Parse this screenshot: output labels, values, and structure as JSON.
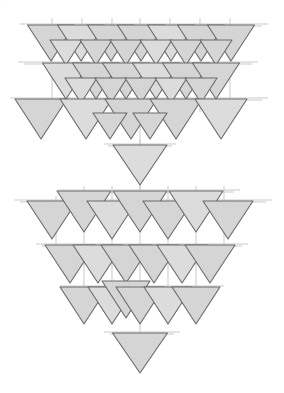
{
  "figure": {
    "corner_mark": "··",
    "canvas": {
      "width": 284,
      "height": 393,
      "background": "#ffffff"
    },
    "style": {
      "triangle_fill": "#d5d5d5",
      "triangle_fill_light": "#dcdcdc",
      "triangle_stroke": "#6a6a6a",
      "triangle_stroke_width": 1.1,
      "guide_line_color": "#c9c9c9",
      "guide_line_width": 1,
      "bar_fill": "#d0d0d0",
      "bar_stroke": "#9a9a9a"
    },
    "clusters": [
      {
        "name": "upper-cluster",
        "rows": 4,
        "apex_count": 1
      },
      {
        "name": "lower-cluster",
        "rows": 4,
        "apex_count": 1
      }
    ]
  },
  "chart_data": {
    "type": "scatter",
    "xlabel": "",
    "ylabel": "",
    "xlim": [
      0,
      284
    ],
    "ylim": [
      0,
      393
    ],
    "grid": false,
    "legend": null,
    "marker": "triangle-down",
    "annotations": [],
    "guide_lines": [
      {
        "orient": "h",
        "x1": 20,
        "x2": 268,
        "y": 24
      },
      {
        "orient": "h",
        "x1": 28,
        "x2": 262,
        "y": 26
      },
      {
        "orient": "h",
        "x1": 18,
        "x2": 258,
        "y": 62
      },
      {
        "orient": "h",
        "x1": 24,
        "x2": 252,
        "y": 64
      },
      {
        "orient": "h",
        "x1": 10,
        "x2": 268,
        "y": 98
      },
      {
        "orient": "h",
        "x1": 16,
        "x2": 262,
        "y": 100
      },
      {
        "orient": "h",
        "x1": 104,
        "x2": 176,
        "y": 144
      },
      {
        "orient": "h",
        "x1": 108,
        "x2": 172,
        "y": 146
      },
      {
        "orient": "h",
        "x1": 58,
        "x2": 240,
        "y": 190
      },
      {
        "orient": "h",
        "x1": 64,
        "x2": 234,
        "y": 192
      },
      {
        "orient": "h",
        "x1": 14,
        "x2": 272,
        "y": 200
      },
      {
        "orient": "h",
        "x1": 20,
        "x2": 266,
        "y": 202
      },
      {
        "orient": "h",
        "x1": 36,
        "x2": 248,
        "y": 244
      },
      {
        "orient": "h",
        "x1": 42,
        "x2": 242,
        "y": 246
      },
      {
        "orient": "h",
        "x1": 60,
        "x2": 224,
        "y": 286
      },
      {
        "orient": "h",
        "x1": 66,
        "x2": 218,
        "y": 288
      },
      {
        "orient": "h",
        "x1": 104,
        "x2": 180,
        "y": 332
      },
      {
        "orient": "h",
        "x1": 110,
        "x2": 174,
        "y": 334
      },
      {
        "orient": "v",
        "x": 52,
        "y1": 18,
        "y2": 110
      },
      {
        "orient": "v",
        "x": 82,
        "y1": 18,
        "y2": 112
      },
      {
        "orient": "v",
        "x": 112,
        "y1": 18,
        "y2": 116
      },
      {
        "orient": "v",
        "x": 140,
        "y1": 18,
        "y2": 182
      },
      {
        "orient": "v",
        "x": 170,
        "y1": 18,
        "y2": 116
      },
      {
        "orient": "v",
        "x": 200,
        "y1": 18,
        "y2": 112
      },
      {
        "orient": "v",
        "x": 230,
        "y1": 18,
        "y2": 108
      },
      {
        "orient": "v",
        "x": 140,
        "y1": 140,
        "y2": 196
      },
      {
        "orient": "v",
        "x": 84,
        "y1": 186,
        "y2": 300
      },
      {
        "orient": "v",
        "x": 112,
        "y1": 186,
        "y2": 300
      },
      {
        "orient": "v",
        "x": 140,
        "y1": 186,
        "y2": 372
      },
      {
        "orient": "v",
        "x": 168,
        "y1": 186,
        "y2": 300
      },
      {
        "orient": "v",
        "x": 196,
        "y1": 186,
        "y2": 300
      },
      {
        "orient": "v",
        "x": 224,
        "y1": 186,
        "y2": 250
      },
      {
        "orient": "v",
        "x": 56,
        "y1": 196,
        "y2": 250
      }
    ],
    "triangles": [
      {
        "cx": 51,
        "cy": 25,
        "w": 47,
        "h": 36,
        "row": "u1"
      },
      {
        "cx": 81,
        "cy": 25,
        "w": 47,
        "h": 36,
        "row": "u1"
      },
      {
        "cx": 111,
        "cy": 25,
        "w": 47,
        "h": 36,
        "row": "u1"
      },
      {
        "cx": 141,
        "cy": 25,
        "w": 47,
        "h": 36,
        "row": "u1"
      },
      {
        "cx": 171,
        "cy": 25,
        "w": 47,
        "h": 36,
        "row": "u1"
      },
      {
        "cx": 201,
        "cy": 25,
        "w": 47,
        "h": 36,
        "row": "u1"
      },
      {
        "cx": 231,
        "cy": 25,
        "w": 47,
        "h": 36,
        "row": "u1"
      },
      {
        "cx": 66,
        "cy": 40,
        "w": 32,
        "h": 25,
        "row": "u1b"
      },
      {
        "cx": 96,
        "cy": 40,
        "w": 32,
        "h": 25,
        "row": "u1b"
      },
      {
        "cx": 126,
        "cy": 40,
        "w": 32,
        "h": 25,
        "row": "u1b"
      },
      {
        "cx": 156,
        "cy": 40,
        "w": 32,
        "h": 25,
        "row": "u1b"
      },
      {
        "cx": 186,
        "cy": 40,
        "w": 32,
        "h": 25,
        "row": "u1b"
      },
      {
        "cx": 216,
        "cy": 40,
        "w": 32,
        "h": 25,
        "row": "u1b"
      },
      {
        "cx": 66,
        "cy": 63,
        "w": 47,
        "h": 36,
        "row": "u2"
      },
      {
        "cx": 96,
        "cy": 63,
        "w": 47,
        "h": 36,
        "row": "u2"
      },
      {
        "cx": 126,
        "cy": 63,
        "w": 47,
        "h": 36,
        "row": "u2"
      },
      {
        "cx": 156,
        "cy": 63,
        "w": 47,
        "h": 36,
        "row": "u2"
      },
      {
        "cx": 186,
        "cy": 63,
        "w": 47,
        "h": 36,
        "row": "u2"
      },
      {
        "cx": 216,
        "cy": 63,
        "w": 47,
        "h": 36,
        "row": "u2"
      },
      {
        "cx": 81,
        "cy": 78,
        "w": 32,
        "h": 25,
        "row": "u2b"
      },
      {
        "cx": 111,
        "cy": 78,
        "w": 32,
        "h": 25,
        "row": "u2b"
      },
      {
        "cx": 141,
        "cy": 78,
        "w": 32,
        "h": 25,
        "row": "u2b"
      },
      {
        "cx": 171,
        "cy": 78,
        "w": 32,
        "h": 25,
        "row": "u2b"
      },
      {
        "cx": 201,
        "cy": 78,
        "w": 32,
        "h": 25,
        "row": "u2b"
      },
      {
        "cx": 41,
        "cy": 99,
        "w": 52,
        "h": 40,
        "row": "u3"
      },
      {
        "cx": 86,
        "cy": 99,
        "w": 52,
        "h": 40,
        "row": "u3"
      },
      {
        "cx": 131,
        "cy": 99,
        "w": 52,
        "h": 40,
        "row": "u3"
      },
      {
        "cx": 176,
        "cy": 99,
        "w": 52,
        "h": 40,
        "row": "u3"
      },
      {
        "cx": 221,
        "cy": 99,
        "w": 52,
        "h": 40,
        "row": "u3"
      },
      {
        "cx": 110,
        "cy": 113,
        "w": 34,
        "h": 26,
        "row": "u3b"
      },
      {
        "cx": 150,
        "cy": 113,
        "w": 34,
        "h": 26,
        "row": "u3b"
      },
      {
        "cx": 140,
        "cy": 145,
        "w": 54,
        "h": 40,
        "row": "u4-apex"
      },
      {
        "cx": 52,
        "cy": 201,
        "w": 50,
        "h": 38,
        "row": "l1"
      },
      {
        "cx": 84,
        "cy": 191,
        "w": 54,
        "h": 41,
        "row": "l1t"
      },
      {
        "cx": 112,
        "cy": 201,
        "w": 50,
        "h": 38,
        "row": "l1"
      },
      {
        "cx": 140,
        "cy": 191,
        "w": 54,
        "h": 41,
        "row": "l1t"
      },
      {
        "cx": 168,
        "cy": 201,
        "w": 50,
        "h": 38,
        "row": "l1"
      },
      {
        "cx": 196,
        "cy": 191,
        "w": 54,
        "h": 41,
        "row": "l1t"
      },
      {
        "cx": 228,
        "cy": 201,
        "w": 50,
        "h": 38,
        "row": "l1"
      },
      {
        "cx": 70,
        "cy": 245,
        "w": 50,
        "h": 38,
        "row": "l2"
      },
      {
        "cx": 98,
        "cy": 245,
        "w": 50,
        "h": 38,
        "row": "l2"
      },
      {
        "cx": 126,
        "cy": 245,
        "w": 50,
        "h": 38,
        "row": "l2"
      },
      {
        "cx": 154,
        "cy": 245,
        "w": 50,
        "h": 38,
        "row": "l2"
      },
      {
        "cx": 182,
        "cy": 245,
        "w": 50,
        "h": 38,
        "row": "l2"
      },
      {
        "cx": 210,
        "cy": 245,
        "w": 50,
        "h": 38,
        "row": "l2"
      },
      {
        "cx": 84,
        "cy": 287,
        "w": 48,
        "h": 37,
        "row": "l3"
      },
      {
        "cx": 112,
        "cy": 287,
        "w": 48,
        "h": 37,
        "row": "l3"
      },
      {
        "cx": 126,
        "cy": 281,
        "w": 48,
        "h": 37,
        "row": "l3t"
      },
      {
        "cx": 140,
        "cy": 287,
        "w": 48,
        "h": 37,
        "row": "l3"
      },
      {
        "cx": 168,
        "cy": 287,
        "w": 48,
        "h": 37,
        "row": "l3"
      },
      {
        "cx": 196,
        "cy": 287,
        "w": 48,
        "h": 37,
        "row": "l3"
      },
      {
        "cx": 140,
        "cy": 333,
        "w": 55,
        "h": 40,
        "row": "l4-apex"
      }
    ]
  }
}
